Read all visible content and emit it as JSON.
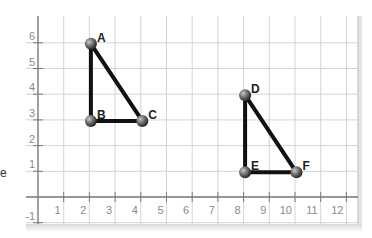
{
  "chart_data": {
    "type": "scatter",
    "title": "",
    "xlabel": "",
    "ylabel": "",
    "xlim": [
      -1,
      12.5
    ],
    "ylim": [
      -1,
      6.7
    ],
    "grid": true,
    "x_ticks": [
      1,
      2,
      3,
      4,
      5,
      6,
      7,
      8,
      9,
      10,
      11,
      12
    ],
    "y_ticks": [
      -1,
      1,
      2,
      3,
      4,
      5,
      6
    ],
    "points": [
      {
        "label": "A",
        "x": 2,
        "y": 6
      },
      {
        "label": "B",
        "x": 2,
        "y": 3
      },
      {
        "label": "C",
        "x": 4,
        "y": 3
      },
      {
        "label": "D",
        "x": 8,
        "y": 4
      },
      {
        "label": "E",
        "x": 8,
        "y": 1
      },
      {
        "label": "F",
        "x": 10,
        "y": 1
      }
    ],
    "polygons": [
      {
        "name": "triangle-ABC",
        "vertices": [
          "A",
          "B",
          "C"
        ]
      },
      {
        "name": "triangle-DEF",
        "vertices": [
          "D",
          "E",
          "F"
        ]
      }
    ]
  },
  "edge_fragment": "e",
  "colors": {
    "grid": "#d4d4d4",
    "axis": "#7a7a7a",
    "tick_text": "#8a8a8a",
    "segment": "#111111",
    "point": "#6b6b6b",
    "label": "#222222"
  }
}
